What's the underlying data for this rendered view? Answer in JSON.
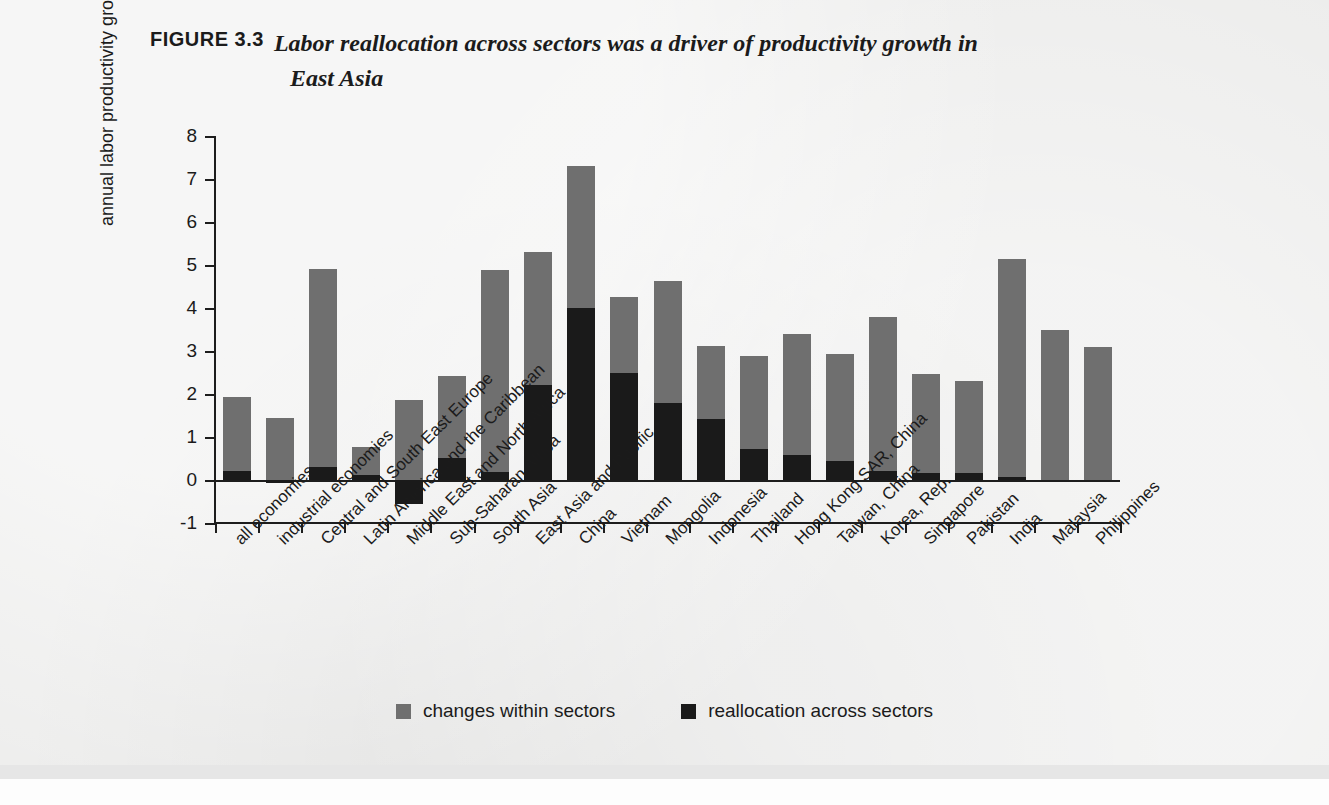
{
  "figure": {
    "label": "FIGURE 3.3",
    "title_line1": "Labor reallocation across sectors was a driver of productivity growth in",
    "title_line2": "East Asia"
  },
  "colors": {
    "within_sectors": "#6f6f6f",
    "reallocation": "#1a1a1a",
    "axis": "#1d1d1d",
    "page_background": "#ececeb"
  },
  "legend": {
    "position": "bottom-center",
    "items": [
      {
        "label": "changes within sectors",
        "color": "#6f6f6f",
        "swatch": "square-gray"
      },
      {
        "label": "reallocation across sectors",
        "color": "#1a1a1a",
        "swatch": "square-black"
      }
    ]
  },
  "chart_data": {
    "type": "bar",
    "stacked": true,
    "title": "Labor reallocation across sectors was a driver of productivity growth in East Asia",
    "xlabel": "",
    "ylabel": "annual labor productivity growth, %",
    "ylim": [
      -1,
      8
    ],
    "yticks": [
      -1,
      0,
      1,
      2,
      3,
      4,
      5,
      6,
      7,
      8
    ],
    "ytick_labels": [
      "-1",
      "0",
      "1",
      "2",
      "3",
      "4",
      "5",
      "6",
      "7",
      "8"
    ],
    "grid": false,
    "categories": [
      "all economies",
      "industrial economies",
      "Central and South East Europe",
      "Latin America and the Caribbean",
      "Middle East and North Africa",
      "Sub-Saharan Africa",
      "South Asia",
      "East Asia and Pacific",
      "China",
      "Vietnam",
      "Mongolia",
      "Indonesia",
      "Thailand",
      "Hong Kong SAR, China",
      "Taiwan, China",
      "Korea, Rep.",
      "Singapore",
      "Pakistan",
      "India",
      "Malaysia",
      "Philippines"
    ],
    "series": [
      {
        "name": "reallocation across sectors",
        "color": "#1a1a1a",
        "values": [
          0.22,
          -0.07,
          0.3,
          0.12,
          -0.55,
          0.52,
          0.18,
          2.2,
          4.0,
          2.5,
          1.8,
          1.42,
          0.72,
          0.57,
          0.44,
          0.2,
          0.16,
          0.17,
          0.08,
          0.0,
          0.0
        ]
      },
      {
        "name": "changes within sectors",
        "color": "#6f6f6f",
        "values": [
          1.7,
          1.45,
          4.6,
          0.65,
          1.85,
          1.9,
          4.7,
          3.1,
          3.3,
          1.75,
          2.82,
          1.7,
          2.16,
          2.83,
          2.48,
          3.6,
          2.31,
          2.13,
          5.07,
          3.48,
          3.1
        ]
      }
    ],
    "totals": [
      1.92,
      1.38,
      4.9,
      0.77,
      1.85,
      2.42,
      4.88,
      5.3,
      7.3,
      4.25,
      4.62,
      3.12,
      2.88,
      3.4,
      2.92,
      3.8,
      2.47,
      2.3,
      5.15,
      3.48,
      3.1
    ]
  }
}
